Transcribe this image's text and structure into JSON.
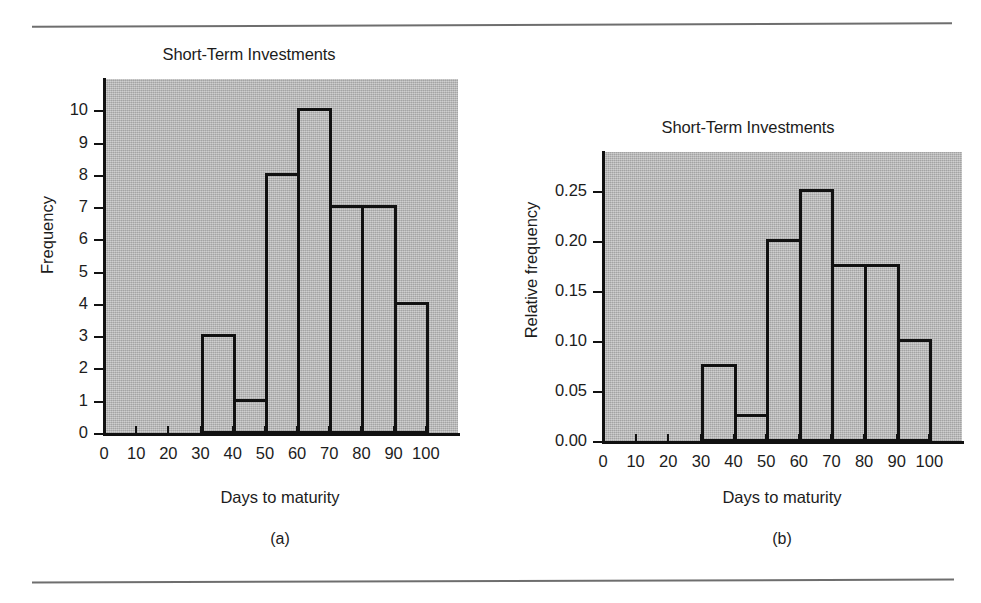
{
  "figure": {
    "panels": [
      {
        "caption": "(a)",
        "title": "Short-Term Investments",
        "xlabel": "Days to maturity",
        "ylabel": "Frequency"
      },
      {
        "caption": "(b)",
        "title": "Short-Term Investments",
        "xlabel": "Days to maturity",
        "ylabel": "Relative frequency"
      }
    ]
  },
  "chart_data": [
    {
      "type": "bar",
      "title": "Short-Term Investments",
      "xlabel": "Days to maturity",
      "ylabel": "Frequency",
      "xlim": [
        0,
        110
      ],
      "ylim": [
        0,
        11
      ],
      "xticks": [
        "0",
        "10",
        "20",
        "30",
        "40",
        "50",
        "60",
        "70",
        "80",
        "90",
        "100"
      ],
      "xtick_values": [
        0,
        10,
        20,
        30,
        40,
        50,
        60,
        70,
        80,
        90,
        100
      ],
      "yticks": [
        "0",
        "1",
        "2",
        "3",
        "4",
        "5",
        "6",
        "7",
        "8",
        "9",
        "10"
      ],
      "ytick_values": [
        0,
        1,
        2,
        3,
        4,
        5,
        6,
        7,
        8,
        9,
        10
      ],
      "grid": false,
      "legend": false,
      "bin_edges": [
        30,
        40,
        50,
        60,
        70,
        80,
        90,
        100
      ],
      "categories": [
        "30-40",
        "40-50",
        "50-60",
        "60-70",
        "70-80",
        "80-90",
        "90-100"
      ],
      "values": [
        3,
        1,
        8,
        10,
        7,
        7,
        4
      ]
    },
    {
      "type": "bar",
      "title": "Short-Term Investments",
      "xlabel": "Days to maturity",
      "ylabel": "Relative frequency",
      "xlim": [
        0,
        110
      ],
      "ylim": [
        0,
        0.29
      ],
      "xticks": [
        "0",
        "10",
        "20",
        "30",
        "40",
        "50",
        "60",
        "70",
        "80",
        "90",
        "100"
      ],
      "xtick_values": [
        0,
        10,
        20,
        30,
        40,
        50,
        60,
        70,
        80,
        90,
        100
      ],
      "yticks": [
        "0.00",
        "0.05",
        "0.10",
        "0.15",
        "0.20",
        "0.25"
      ],
      "ytick_values": [
        0.0,
        0.05,
        0.1,
        0.15,
        0.2,
        0.25
      ],
      "grid": false,
      "legend": false,
      "bin_edges": [
        30,
        40,
        50,
        60,
        70,
        80,
        90,
        100
      ],
      "categories": [
        "30-40",
        "40-50",
        "50-60",
        "60-70",
        "70-80",
        "80-90",
        "90-100"
      ],
      "values": [
        0.075,
        0.025,
        0.2,
        0.25,
        0.175,
        0.175,
        0.1
      ]
    }
  ],
  "style": {
    "plot_background": "#b3b3b3",
    "ink": "#111111",
    "page_background": "#ffffff",
    "rule_color": "#6e6e6e"
  }
}
